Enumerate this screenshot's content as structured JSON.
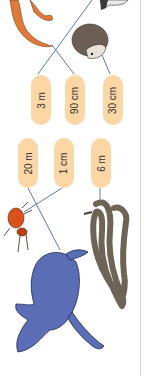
{
  "exercise": {
    "type": "matching",
    "orientation": "rotated-90",
    "labels_top_row": [
      "3 m",
      "90 cm",
      "30 cm"
    ],
    "labels_bottom_row": [
      "20 m",
      "1 cm",
      "6 m"
    ]
  },
  "animals": [
    {
      "name": "fox",
      "icon": "fox-icon"
    },
    {
      "name": "badger",
      "icon": "badger-icon"
    },
    {
      "name": "hedgehog",
      "icon": "hedgehog-icon"
    },
    {
      "name": "beetle",
      "icon": "beetle-icon"
    },
    {
      "name": "whale",
      "icon": "whale-icon"
    },
    {
      "name": "snake",
      "icon": "snake-icon"
    }
  ],
  "colors": {
    "label_fill": "#fbd7a6",
    "line": "#5a7ab0",
    "fox": "#e07a3a",
    "whale": "#5b6eb5",
    "beetle": "#d9521c",
    "snake": "#6e6456",
    "hedgehog": "#6b5e52"
  }
}
